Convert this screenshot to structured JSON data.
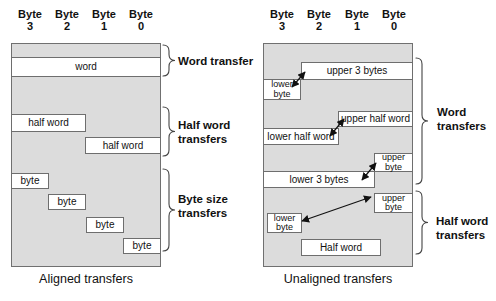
{
  "colors": {
    "panel_fill": "#dcdcdc",
    "panel_border": "#707070",
    "box_fill": "#ffffff",
    "box_border": "#6e6e6e",
    "ink": "#111111"
  },
  "left": {
    "headers": [
      [
        "Byte",
        "3"
      ],
      [
        "Byte",
        "2"
      ],
      [
        "Byte",
        "1"
      ],
      [
        "Byte",
        "0"
      ]
    ],
    "boxes": {
      "word": "word",
      "half_word_upper": "half word",
      "half_word_lower": "half word",
      "byte_3": "byte",
      "byte_2": "byte",
      "byte_1": "byte",
      "byte_0": "byte"
    },
    "groups": {
      "word": [
        "Word transfer"
      ],
      "half_word": [
        "Half word",
        "transfers"
      ],
      "byte_size": [
        "Byte size",
        "transfers"
      ]
    },
    "caption": "Aligned transfers"
  },
  "right": {
    "headers": [
      [
        "Byte",
        "3"
      ],
      [
        "Byte",
        "2"
      ],
      [
        "Byte",
        "1"
      ],
      [
        "Byte",
        "0"
      ]
    ],
    "boxes": {
      "upper_3_bytes": "upper 3 bytes",
      "lower_byte_word": "lower byte",
      "upper_half_word": "upper half word",
      "lower_half_word": "lower half word",
      "upper_byte_word": "upper byte",
      "lower_3_bytes": "lower 3 bytes",
      "upper_byte_half": "upper byte",
      "lower_byte_half": "lower byte",
      "half_word": "Half word"
    },
    "groups": {
      "word": [
        "Word",
        "transfers"
      ],
      "half_word": [
        "Half word",
        "transfers"
      ]
    },
    "caption": "Unaligned transfers"
  }
}
